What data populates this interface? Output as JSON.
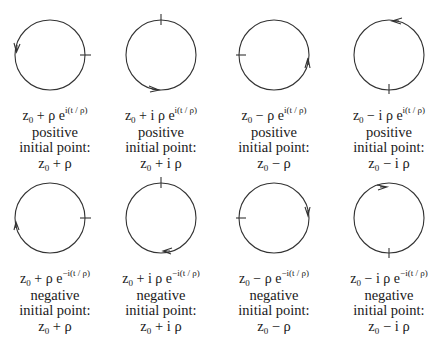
{
  "figure": {
    "stroke_color": "#333333",
    "rows": [
      {
        "row": "top",
        "cells": [
          {
            "base": "z",
            "sub": "0",
            "op": " + ρ e",
            "exp": "i(t / ρ)",
            "orientation": "positive",
            "label": "initial point:",
            "pt_base": "z",
            "pt_sub": "0",
            "pt_rest": " + ρ",
            "cx": 50,
            "cy": 55,
            "tick": "right",
            "arrow": "left-down"
          },
          {
            "base": "z",
            "sub": "0",
            "op": " + i ρ e",
            "exp": "i(t / ρ)",
            "orientation": "positive",
            "label": "initial point:",
            "pt_base": "z",
            "pt_sub": "0",
            "pt_rest": " + i ρ",
            "cx": 161,
            "cy": 55,
            "tick": "top",
            "arrow": "bottom-right"
          },
          {
            "base": "z",
            "sub": "0",
            "op": " − ρ e",
            "exp": "i(t / ρ)",
            "orientation": "positive",
            "label": "initial point:",
            "pt_base": "z",
            "pt_sub": "0",
            "pt_rest": " − ρ",
            "cx": 274,
            "cy": 55,
            "tick": "left",
            "arrow": "right-up"
          },
          {
            "base": "z",
            "sub": "0",
            "op": " − i ρ e",
            "exp": "i(t / ρ)",
            "orientation": "positive",
            "label": "initial point:",
            "pt_base": "z",
            "pt_sub": "0",
            "pt_rest": " − i ρ",
            "cx": 389,
            "cy": 55,
            "tick": "bottom",
            "arrow": "top-left"
          }
        ]
      },
      {
        "row": "bottom",
        "cells": [
          {
            "base": "z",
            "sub": "0",
            "op": " + ρ e",
            "exp": "−i(t / ρ)",
            "orientation": "negative",
            "label": "initial point:",
            "pt_base": "z",
            "pt_sub": "0",
            "pt_rest": " + ρ",
            "cx": 50,
            "cy": 218,
            "tick": "right",
            "arrow": "left-up"
          },
          {
            "base": "z",
            "sub": "0",
            "op": " + i ρ e",
            "exp": "−i(t / ρ)",
            "orientation": "negative",
            "label": "initial point:",
            "pt_base": "z",
            "pt_sub": "0",
            "pt_rest": " + i ρ",
            "cx": 161,
            "cy": 218,
            "tick": "top",
            "arrow": "bottom-left"
          },
          {
            "base": "z",
            "sub": "0",
            "op": " − ρ e",
            "exp": "−i(t / ρ)",
            "orientation": "negative",
            "label": "initial point:",
            "pt_base": "z",
            "pt_sub": "0",
            "pt_rest": " − ρ",
            "cx": 274,
            "cy": 218,
            "tick": "left",
            "arrow": "right-down"
          },
          {
            "base": "z",
            "sub": "0",
            "op": " − i ρ e",
            "exp": "−i(t / ρ)",
            "orientation": "negative",
            "label": "initial point:",
            "pt_base": "z",
            "pt_sub": "0",
            "pt_rest": " − i ρ",
            "cx": 389,
            "cy": 218,
            "tick": "bottom",
            "arrow": "top-right"
          }
        ]
      }
    ]
  }
}
